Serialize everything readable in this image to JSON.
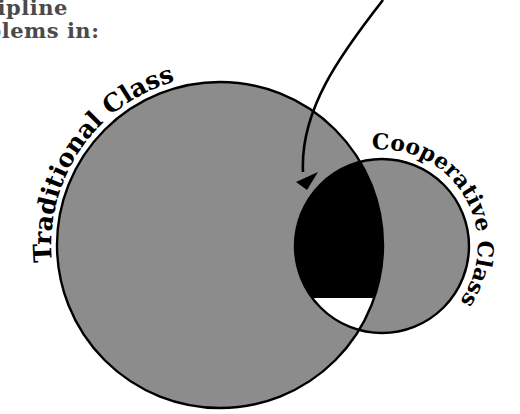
{
  "heading": {
    "line1": "Discipline",
    "line2": "Problems in:",
    "visible_line1": "scipline",
    "visible_line2": "oblems in:",
    "color": "#4a4a4a"
  },
  "diagram": {
    "type": "venn",
    "sets": [
      {
        "label": "Traditional Class",
        "center": [
          220,
          245
        ],
        "radius": 163,
        "fill": "#8c8c8c"
      },
      {
        "label": "Cooperative Class",
        "center": [
          382,
          246
        ],
        "radius": 87,
        "fill": "#8c8c8c"
      }
    ],
    "overlap": {
      "fill_main": "#000000",
      "fill_bottom_segment": "#ffffff"
    },
    "arrow": {
      "description": "curved arrow from top pointing into overlap region",
      "color": "#000000"
    },
    "outline_color": "#000000"
  }
}
